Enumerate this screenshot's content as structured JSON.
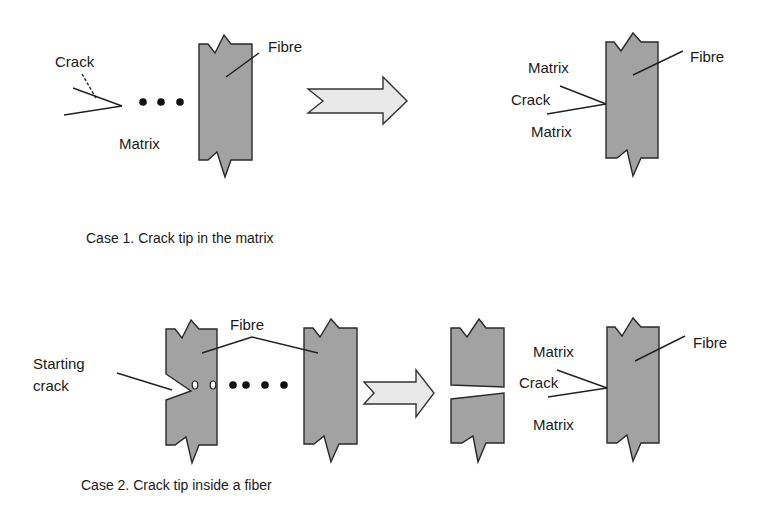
{
  "colors": {
    "fibre_fill": "#a2a2a2",
    "arrow_fill": "#e9e9e9",
    "stroke": "#2a2a2a",
    "text": "#1a1a1a"
  },
  "case1": {
    "caption": "Case 1.  Crack tip in the matrix",
    "before": {
      "crack_label": "Crack",
      "matrix_label": "Matrix",
      "fibre_label": "Fibre"
    },
    "after": {
      "matrix_top_label": "Matrix",
      "crack_label": "Crack",
      "matrix_bottom_label": "Matrix",
      "fibre_label": "Fibre"
    }
  },
  "case2": {
    "caption": "Case 2. Crack tip inside a fiber",
    "before": {
      "starting_crack_label_line1": "Starting",
      "starting_crack_label_line2": "crack",
      "fibre_label": "Fibre"
    },
    "after": {
      "matrix_top_label": "Matrix",
      "crack_label": "Crack",
      "matrix_bottom_label": "Matrix",
      "fibre_label": "Fibre"
    }
  }
}
